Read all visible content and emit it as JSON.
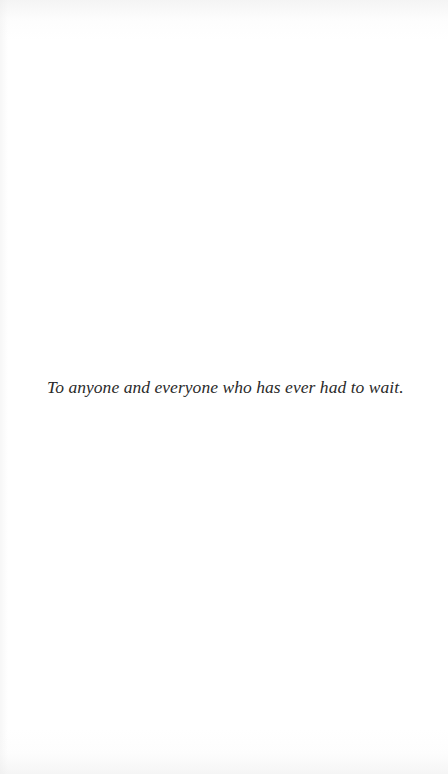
{
  "page": {
    "type": "dedication",
    "dedication_text": "To anyone and everyone who has ever had to wait."
  },
  "colors": {
    "background": "#ffffff",
    "text": "#2a2a2a"
  }
}
